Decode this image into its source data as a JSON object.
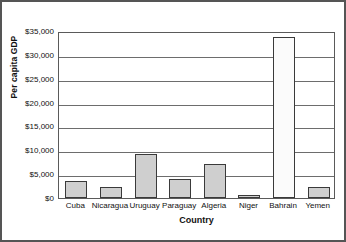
{
  "chart_data": {
    "type": "bar",
    "title": "",
    "xlabel": "Country",
    "ylabel": "Per capita GDP",
    "categories": [
      "Cuba",
      "Nicaragua",
      "Uruguay",
      "Paraguay",
      "Algeria",
      "Niger",
      "Bahrain",
      "Yemen"
    ],
    "values": [
      3600,
      2300,
      9300,
      4000,
      7200,
      700,
      33700,
      2300
    ],
    "ylim": [
      0,
      35000
    ],
    "ytick_values": [
      0,
      5000,
      10000,
      15000,
      20000,
      25000,
      30000,
      35000
    ],
    "ytick_labels": [
      "$0",
      "$5,000",
      "$10,000",
      "$15,000",
      "$20,000",
      "$25,000",
      "$30,000",
      "$35,000"
    ],
    "grid": true,
    "grid_axis": "y",
    "legend": false,
    "legend_position": "none",
    "bar_fill_color": "#cfcfcf",
    "bar_edge_color": "#3a3a3a",
    "highlight_bar": "Bahrain",
    "highlight_fill_color": "#fbfbfb",
    "plot_background": "#ffffff",
    "frame_color": "#555555"
  }
}
